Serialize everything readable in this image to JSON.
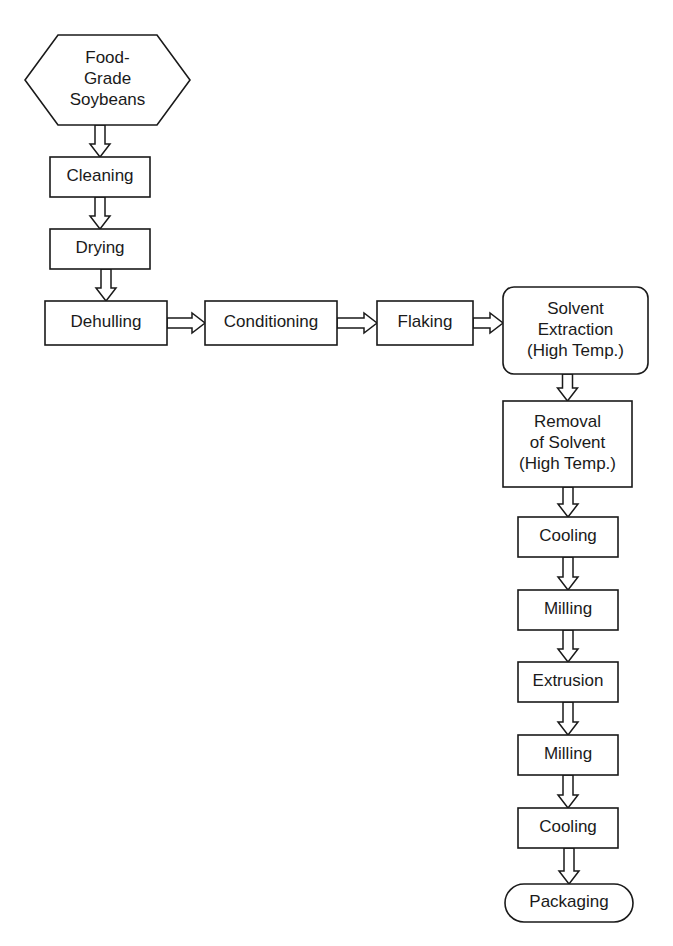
{
  "diagram": {
    "background_color": "#ffffff",
    "line_color": "#1a1a1a",
    "nodes": [
      {
        "id": "food-grade-soybeans",
        "shape": "hexagon",
        "lines": [
          "Food-",
          "Grade",
          "Soybeans"
        ],
        "x": 25,
        "y": 35,
        "w": 165,
        "h": 90
      },
      {
        "id": "cleaning",
        "shape": "rect",
        "lines": [
          "Cleaning"
        ],
        "x": 50,
        "y": 157,
        "w": 100,
        "h": 40
      },
      {
        "id": "drying",
        "shape": "rect",
        "lines": [
          "Drying"
        ],
        "x": 50,
        "y": 229,
        "w": 100,
        "h": 40
      },
      {
        "id": "dehulling",
        "shape": "rect",
        "lines": [
          "Dehulling"
        ],
        "x": 45,
        "y": 301,
        "w": 122,
        "h": 44
      },
      {
        "id": "conditioning",
        "shape": "rect",
        "lines": [
          "Conditioning"
        ],
        "x": 205,
        "y": 301,
        "w": 132,
        "h": 44
      },
      {
        "id": "flaking",
        "shape": "rect",
        "lines": [
          "Flaking"
        ],
        "x": 377,
        "y": 301,
        "w": 96,
        "h": 44
      },
      {
        "id": "solvent-extraction",
        "shape": "rounded-rect",
        "lines": [
          "Solvent",
          "Extraction",
          "(High Temp.)"
        ],
        "x": 503,
        "y": 287,
        "w": 145,
        "h": 87
      },
      {
        "id": "removal-of-solvent",
        "shape": "rect",
        "lines": [
          "Removal",
          "of Solvent",
          "(High Temp.)"
        ],
        "x": 503,
        "y": 401,
        "w": 129,
        "h": 86
      },
      {
        "id": "cooling-1",
        "shape": "rect",
        "lines": [
          "Cooling"
        ],
        "x": 518,
        "y": 517,
        "w": 100,
        "h": 40
      },
      {
        "id": "milling-1",
        "shape": "rect",
        "lines": [
          "Milling"
        ],
        "x": 518,
        "y": 590,
        "w": 100,
        "h": 40
      },
      {
        "id": "extrusion",
        "shape": "rect",
        "lines": [
          "Extrusion"
        ],
        "x": 518,
        "y": 662,
        "w": 100,
        "h": 40
      },
      {
        "id": "milling-2",
        "shape": "rect",
        "lines": [
          "Milling"
        ],
        "x": 518,
        "y": 735,
        "w": 100,
        "h": 40
      },
      {
        "id": "cooling-2",
        "shape": "rect",
        "lines": [
          "Cooling"
        ],
        "x": 518,
        "y": 808,
        "w": 100,
        "h": 40
      },
      {
        "id": "packaging",
        "shape": "stadium",
        "lines": [
          "Packaging"
        ],
        "x": 505,
        "y": 884,
        "w": 128,
        "h": 38
      }
    ],
    "edges": [
      {
        "id": "soybeans-to-cleaning",
        "from": "food-grade-soybeans",
        "to": "cleaning",
        "direction": "down"
      },
      {
        "id": "cleaning-to-drying",
        "from": "cleaning",
        "to": "drying",
        "direction": "down"
      },
      {
        "id": "drying-to-dehulling",
        "from": "drying",
        "to": "dehulling",
        "direction": "down"
      },
      {
        "id": "dehulling-to-conditioning",
        "from": "dehulling",
        "to": "conditioning",
        "direction": "right"
      },
      {
        "id": "conditioning-to-flaking",
        "from": "conditioning",
        "to": "flaking",
        "direction": "right"
      },
      {
        "id": "flaking-to-solvent-extraction",
        "from": "flaking",
        "to": "solvent-extraction",
        "direction": "right"
      },
      {
        "id": "solvent-extraction-to-removal",
        "from": "solvent-extraction",
        "to": "removal-of-solvent",
        "direction": "down"
      },
      {
        "id": "removal-to-cooling-1",
        "from": "removal-of-solvent",
        "to": "cooling-1",
        "direction": "down"
      },
      {
        "id": "cooling-1-to-milling-1",
        "from": "cooling-1",
        "to": "milling-1",
        "direction": "down"
      },
      {
        "id": "milling-1-to-extrusion",
        "from": "milling-1",
        "to": "extrusion",
        "direction": "down"
      },
      {
        "id": "extrusion-to-milling-2",
        "from": "extrusion",
        "to": "milling-2",
        "direction": "down"
      },
      {
        "id": "milling-2-to-cooling-2",
        "from": "milling-2",
        "to": "cooling-2",
        "direction": "down"
      },
      {
        "id": "cooling-2-to-packaging",
        "from": "cooling-2",
        "to": "packaging",
        "direction": "down"
      }
    ]
  }
}
